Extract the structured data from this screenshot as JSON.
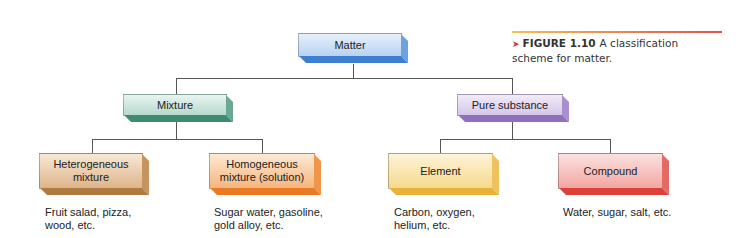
{
  "diagram": {
    "title_caption": {
      "marker": "➤",
      "figure_label": "FIGURE 1.10",
      "text": "A classification scheme for matter."
    },
    "root": {
      "label": "Matter",
      "color": "#b7d3f2"
    },
    "level1": [
      {
        "label": "Mixture",
        "color": "#b6d9cc"
      },
      {
        "label": "Pure substance",
        "color": "#d6c6ea"
      }
    ],
    "level2": [
      {
        "label_line1": "Heterogeneous",
        "label_line2": "mixture",
        "color": "#deb489",
        "example_line1": "Fruit salad, pizza,",
        "example_line2": "wood, etc."
      },
      {
        "label_line1": "Homogeneous",
        "label_line2": "mixture (solution)",
        "color": "#f6b57c",
        "example_line1": "Sugar water, gasoline,",
        "example_line2": "gold alloy, etc."
      },
      {
        "label_line1": "Element",
        "label_line2": "",
        "color": "#f6d98c",
        "example_line1": "Carbon, oxygen,",
        "example_line2": "helium, etc."
      },
      {
        "label_line1": "Compound",
        "label_line2": "",
        "color": "#f3a6a2",
        "example_line1": "Water, sugar, salt, etc.",
        "example_line2": ""
      }
    ],
    "edges": [
      [
        "Matter",
        "Mixture"
      ],
      [
        "Matter",
        "Pure substance"
      ],
      [
        "Mixture",
        "Heterogeneous mixture"
      ],
      [
        "Mixture",
        "Homogeneous mixture (solution)"
      ],
      [
        "Pure substance",
        "Element"
      ],
      [
        "Pure substance",
        "Compound"
      ]
    ]
  }
}
